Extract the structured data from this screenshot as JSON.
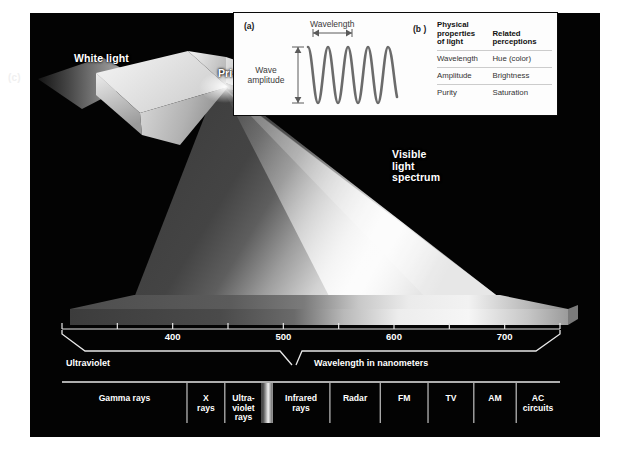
{
  "figure": {
    "part_c_tag": "(c)",
    "white_light_label": "White light",
    "prism_label": "Prism",
    "visible_spectrum_label": "Visible\nlight\nspectrum"
  },
  "inset_a": {
    "tag": "(a)",
    "wavelength_label": "Wavelength",
    "amplitude_label": "Wave\namplitude"
  },
  "inset_b": {
    "tag": "(b )",
    "headers": [
      "Physical\nproperties\nof light",
      "Related\nperceptions"
    ],
    "rows": [
      [
        "Wavelength",
        "Hue (color)"
      ],
      [
        "Amplitude",
        "Brightness"
      ],
      [
        "Purity",
        "Saturation"
      ]
    ]
  },
  "ruler": {
    "axis_title": "Wavelength in nanometers",
    "ultraviolet_label": "Ultraviolet",
    "tick_labels": [
      "",
      "",
      "400",
      "",
      "500",
      "",
      "600",
      "",
      "700",
      ""
    ],
    "tick_values": [
      300,
      350,
      400,
      450,
      500,
      550,
      600,
      650,
      700,
      750
    ]
  },
  "em_spectrum": {
    "bands": [
      {
        "label": "Gamma rays",
        "start": 0.0,
        "end": 0.251
      },
      {
        "label": "X\nrays",
        "start": 0.251,
        "end": 0.327
      },
      {
        "label": "Ultra-\nviolet\nrays",
        "start": 0.327,
        "end": 0.402
      },
      {
        "label": "",
        "start": 0.402,
        "end": 0.422
      },
      {
        "label": "Infrared\nrays",
        "start": 0.422,
        "end": 0.538
      },
      {
        "label": "Radar",
        "start": 0.538,
        "end": 0.639
      },
      {
        "label": "FM",
        "start": 0.639,
        "end": 0.735
      },
      {
        "label": "TV",
        "start": 0.735,
        "end": 0.827
      },
      {
        "label": "AM",
        "start": 0.827,
        "end": 0.912
      },
      {
        "label": "AC\ncircuits",
        "start": 0.912,
        "end": 1.0
      }
    ]
  },
  "colors": {
    "panel_background": "#030303",
    "inset_background": "#fdfdfd",
    "text_light": "#ffffff",
    "text_dark": "#1a1a1a",
    "wave_stroke": "#6b6b6b",
    "rule_line": "#e8e8e8"
  }
}
